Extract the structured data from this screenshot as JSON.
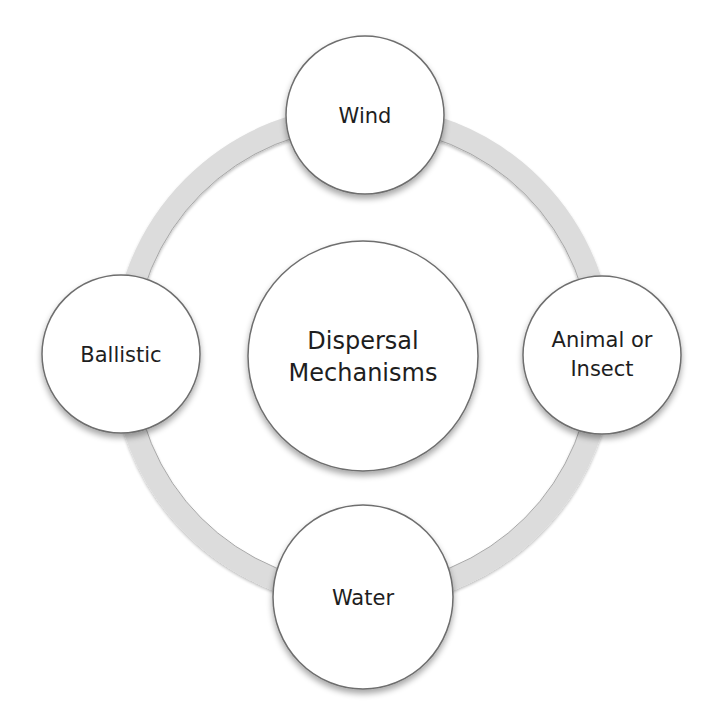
{
  "diagram": {
    "type": "cycle",
    "colors": {
      "background": "#ffffff",
      "ring": "#dcdcdc",
      "ring_edge": "#9a9a9a",
      "node_fill": "#ffffff",
      "node_stroke": "#6e6e6e",
      "text": "#1e1e1e"
    },
    "center": {
      "lines": [
        "Dispersal",
        "Mechanisms"
      ]
    },
    "nodes": [
      {
        "id": "wind",
        "lines": [
          "Wind"
        ]
      },
      {
        "id": "animal-or-insect",
        "lines": [
          "Animal or",
          "Insect"
        ]
      },
      {
        "id": "water",
        "lines": [
          "Water"
        ]
      },
      {
        "id": "ballistic",
        "lines": [
          "Ballistic"
        ]
      }
    ]
  }
}
